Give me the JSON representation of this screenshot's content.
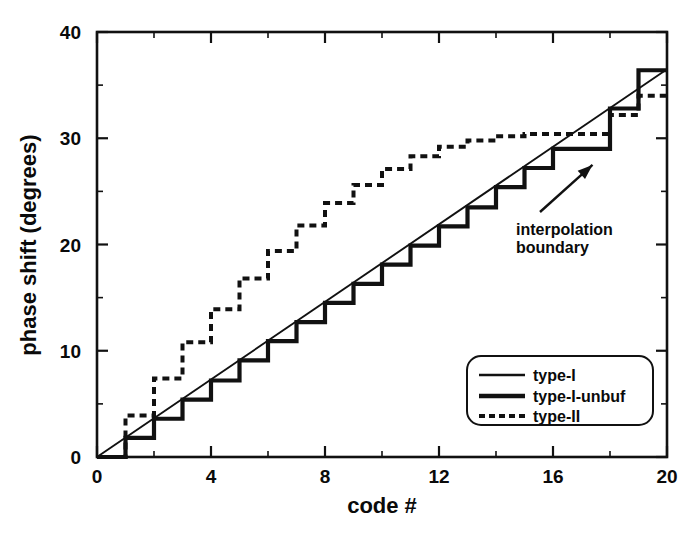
{
  "chart_data": {
    "type": "line",
    "title": "",
    "xlabel": "code #",
    "ylabel": "phase shift (degrees)",
    "xlim": [
      0,
      20
    ],
    "ylim": [
      0,
      40
    ],
    "xticks": [
      0,
      4,
      8,
      12,
      16,
      20
    ],
    "xtick_labels": [
      "0",
      "4",
      "8",
      "12",
      "16",
      "20"
    ],
    "xminor_step": 2,
    "yticks": [
      0,
      10,
      20,
      30,
      40
    ],
    "ytick_labels": [
      "0",
      "10",
      "20",
      "30",
      "40"
    ],
    "yminor_step": 5,
    "grid": false,
    "legend_position": "lower-right",
    "series": [
      {
        "name": "type-I",
        "style": "thin-solid-line",
        "x": [
          0,
          20
        ],
        "values": [
          0,
          36.5
        ]
      },
      {
        "name": "type-I-unbuf",
        "style": "thick-solid-staircase",
        "x": [
          0,
          1,
          2,
          3,
          4,
          5,
          6,
          7,
          8,
          9,
          10,
          11,
          12,
          13,
          14,
          15,
          16,
          17,
          18,
          19
        ],
        "values": [
          0,
          1.8,
          3.6,
          5.4,
          7.2,
          9.1,
          10.9,
          12.7,
          14.5,
          16.3,
          18.1,
          19.9,
          21.7,
          23.5,
          25.4,
          27.2,
          29.0,
          29.0,
          32.8,
          36.4
        ]
      },
      {
        "name": "type-II",
        "style": "dashed-staircase",
        "x": [
          0,
          1,
          2,
          3,
          4,
          5,
          6,
          7,
          8,
          9,
          10,
          11,
          12,
          13,
          14,
          15,
          16,
          17,
          18,
          19
        ],
        "values": [
          0,
          3.9,
          7.4,
          10.8,
          13.9,
          16.8,
          19.4,
          21.8,
          23.9,
          25.6,
          27.1,
          28.3,
          29.2,
          29.8,
          30.2,
          30.4,
          30.4,
          30.4,
          32.2,
          34.0
        ]
      }
    ],
    "annotations": [
      {
        "text_line_1": "interpolation",
        "text_line_2": "boundary",
        "points_to_x": 17.0,
        "points_to_y": 28.9
      }
    ]
  },
  "legend": {
    "entries": [
      {
        "label": "type-I",
        "style": "thin-solid-line"
      },
      {
        "label": "type-I-unbuf",
        "style": "thick-solid-line"
      },
      {
        "label": "type-II",
        "style": "dashed-line"
      }
    ]
  },
  "colors": {
    "ink": "#111111",
    "background": "#ffffff"
  }
}
